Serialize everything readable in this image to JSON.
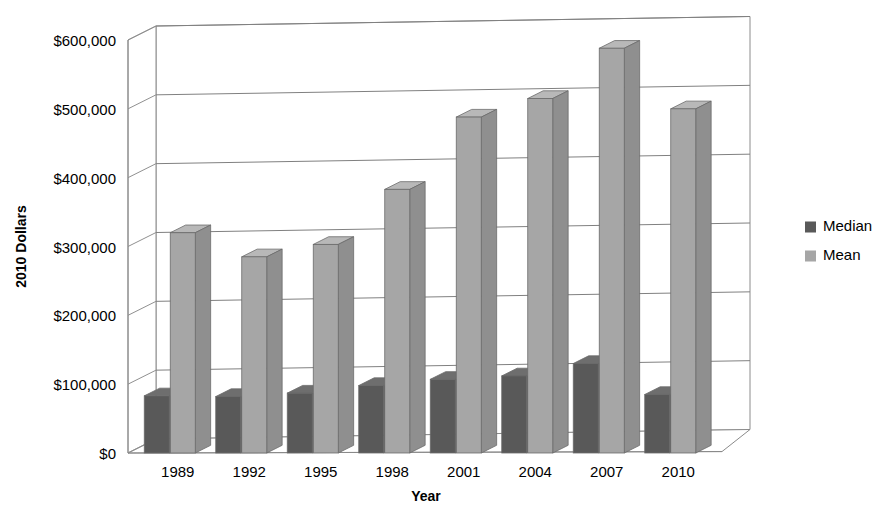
{
  "chart_data": {
    "type": "bar",
    "title": "",
    "subtitle": "",
    "xlabel": "Year",
    "ylabel": "2010 Dollars",
    "categories": [
      "1989",
      "1992",
      "1995",
      "1998",
      "2001",
      "2004",
      "2007",
      "2010"
    ],
    "series": [
      {
        "name": "Median",
        "color": "#595959",
        "values": [
          83000,
          82000,
          87000,
          98000,
          107000,
          112000,
          130000,
          85000
        ]
      },
      {
        "name": "Mean",
        "color": "#a6a6a6",
        "values": [
          320000,
          285000,
          303000,
          383000,
          488000,
          515000,
          588000,
          500000
        ]
      }
    ],
    "ylim": [
      0,
      600000
    ],
    "ytick_values": [
      0,
      100000,
      200000,
      300000,
      400000,
      500000,
      600000
    ],
    "ytick_labels": [
      "$0",
      "$100,000",
      "$200,000",
      "$300,000",
      "$400,000",
      "$500,000",
      "$600,000"
    ],
    "grid": true,
    "grid_axis": "y",
    "legend_position": "right",
    "style": "3d-column",
    "background": "#ffffff"
  },
  "legend": {
    "entries": [
      {
        "label": "Median",
        "swatch": "#595959"
      },
      {
        "label": "Mean",
        "swatch": "#a6a6a6"
      }
    ]
  },
  "axes": {
    "y_title": "2010 Dollars",
    "x_title": "Year"
  }
}
